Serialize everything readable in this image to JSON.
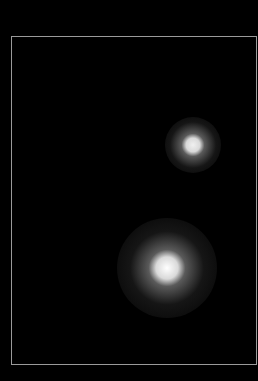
{
  "image": {
    "background": "#000000",
    "frame": {
      "left": 11,
      "top": 36,
      "right": 256,
      "bottom": 364,
      "border_color": "#9a9a9a"
    },
    "spots": [
      {
        "name": "upper-spot",
        "cx": 193,
        "cy": 145,
        "core_radius": 8,
        "halo_radius": 28,
        "peak_color": "#f0f0f0"
      },
      {
        "name": "lower-spot",
        "cx": 167,
        "cy": 268,
        "core_radius": 13,
        "halo_radius": 50,
        "peak_color": "#ffffff"
      }
    ]
  }
}
